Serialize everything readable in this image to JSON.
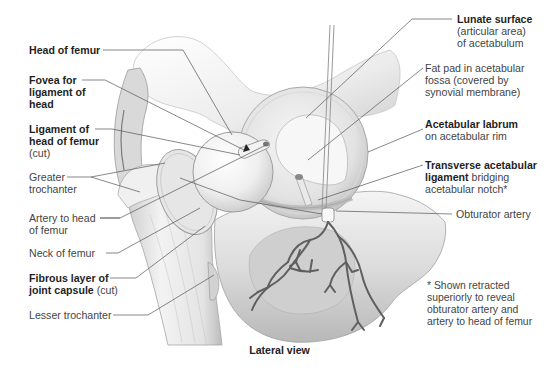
{
  "diagram": {
    "caption": "Lateral view",
    "colors": {
      "leader_line": "#555555",
      "bone_light": "#f2f2f2",
      "bone_mid": "#d6d6d6",
      "bone_shadow": "#a9a9a9",
      "artery": "#5a5a5a",
      "text_bold": "#1f1f1f",
      "text_regular": "#444444"
    },
    "left_labels": [
      {
        "id": "head-of-femur",
        "bold": "Head of femur",
        "regular": "",
        "lines": [
          "Head of femur"
        ]
      },
      {
        "id": "fovea",
        "bold": "Fovea for ligament of head",
        "lines": [
          "Fovea for",
          "ligament of",
          "head"
        ]
      },
      {
        "id": "ligament-head",
        "bold": "Ligament of head of femur",
        "regular": "(cut)",
        "lines": [
          "Ligament of",
          "head of femur"
        ],
        "suffix_line": "(cut)"
      },
      {
        "id": "greater-trochanter",
        "regular": "Greater trochanter",
        "lines": [
          "Greater",
          "trochanter"
        ]
      },
      {
        "id": "artery-head",
        "regular": "Artery to head of femur",
        "lines": [
          "Artery to head",
          "of femur"
        ]
      },
      {
        "id": "neck-femur",
        "regular": "Neck of femur",
        "lines": [
          "Neck of femur"
        ]
      },
      {
        "id": "fibrous-layer",
        "bold": "Fibrous layer of joint capsule",
        "regular": "(cut)",
        "lines": [
          "Fibrous layer of",
          "joint capsule"
        ],
        "inline_suffix": " (cut)"
      },
      {
        "id": "lesser-trochanter",
        "regular": "Lesser trochanter",
        "lines": [
          "Lesser trochanter"
        ]
      }
    ],
    "right_labels": [
      {
        "id": "lunate-surface",
        "bold": "Lunate surface",
        "regular_lines": [
          "(articular area)",
          "of acetabulum"
        ]
      },
      {
        "id": "fat-pad",
        "regular_lines": [
          "Fat pad in acetabular",
          "fossa (covered by",
          "synovial membrane)"
        ]
      },
      {
        "id": "acetabular-labrum",
        "bold": "Acetabular labrum",
        "regular_lines": [
          "on acetabular rim"
        ]
      },
      {
        "id": "transverse-ligament",
        "bold_lines": [
          "Transverse acetabular",
          "ligament"
        ],
        "inline_regular": " bridging",
        "regular_lines": [
          "acetabular notch*"
        ]
      },
      {
        "id": "obturator-artery",
        "regular_lines": [
          "Obturator artery"
        ]
      }
    ],
    "footnote": [
      "* Shown retracted",
      "superiorly to reveal",
      "obturator artery and",
      "artery to head of femur"
    ]
  }
}
